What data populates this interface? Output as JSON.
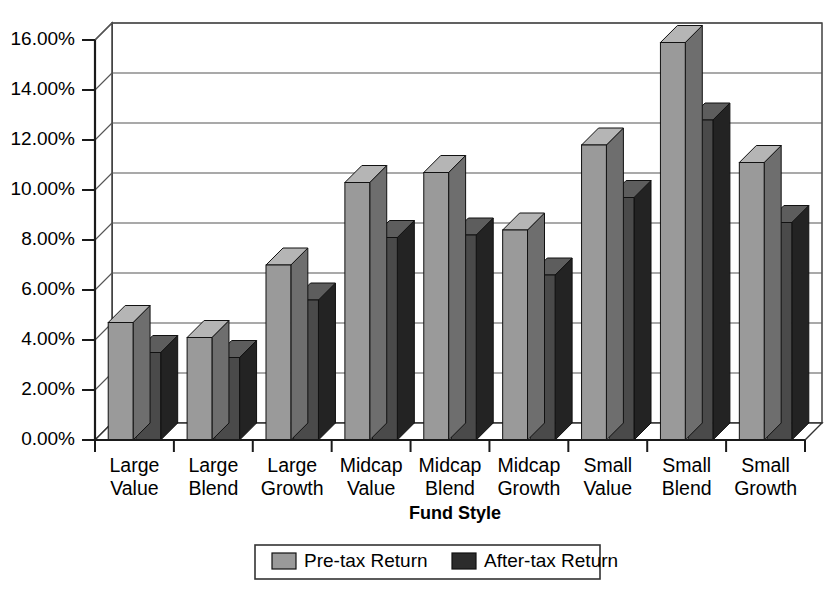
{
  "chart_data": {
    "type": "bar",
    "title": "",
    "xlabel": "Fund Style",
    "ylabel": "",
    "ylim": [
      0,
      16
    ],
    "ytick_labels": [
      "0.00%",
      "2.00%",
      "4.00%",
      "6.00%",
      "8.00%",
      "10.00%",
      "12.00%",
      "14.00%",
      "16.00%"
    ],
    "ytick_values": [
      0,
      2,
      4,
      6,
      8,
      10,
      12,
      14,
      16
    ],
    "grid": true,
    "legend_position": "bottom",
    "three_d": true,
    "categories": [
      "Large Value",
      "Large Blend",
      "Large Growth",
      "Midcap Value",
      "Midcap Blend",
      "Midcap Growth",
      "Small Value",
      "Small Blend",
      "Small Growth"
    ],
    "category_lines": [
      [
        "Large",
        "Value"
      ],
      [
        "Large",
        "Blend"
      ],
      [
        "Large",
        "Growth"
      ],
      [
        "Midcap",
        "Value"
      ],
      [
        "Midcap",
        "Blend"
      ],
      [
        "Midcap",
        "Growth"
      ],
      [
        "Small",
        "Value"
      ],
      [
        "Small",
        "Blend"
      ],
      [
        "Small",
        "Growth"
      ]
    ],
    "series": [
      {
        "name": "Pre-tax Return",
        "color": "#9a9a9a",
        "values": [
          4.7,
          4.1,
          7.0,
          10.3,
          10.7,
          8.4,
          11.8,
          15.9,
          11.1
        ]
      },
      {
        "name": "After-tax Return",
        "color": "#4a4a4a",
        "values": [
          3.5,
          3.3,
          5.6,
          8.1,
          8.2,
          6.6,
          9.7,
          12.8,
          8.7
        ]
      }
    ]
  },
  "legend": {
    "items": [
      {
        "label": "Pre-tax Return",
        "color": "#9a9a9a"
      },
      {
        "label": "After-tax Return",
        "color": "#2c2c2c"
      }
    ]
  },
  "axis": {
    "x_title": "Fund Style"
  },
  "caption": {
    "partial_text": ""
  },
  "colors": {
    "pretax_front": "#9a9a9a",
    "pretax_top": "#b5b5b5",
    "pretax_side": "#6e6e6e",
    "aftertax_front": "#4a4a4a",
    "aftertax_top": "#5d5d5d",
    "aftertax_side": "#232323",
    "plot_bg": "#ffffff",
    "floor": "#8e8e8e",
    "axis_line": "#222222",
    "grid_line": "#555555"
  }
}
